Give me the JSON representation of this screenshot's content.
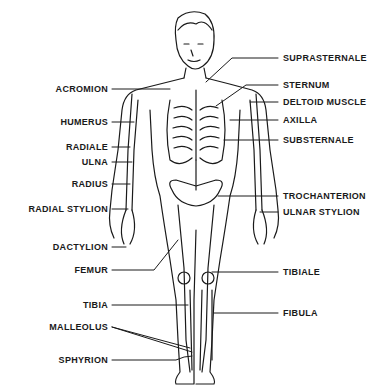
{
  "diagram": {
    "type": "anatomical-landmarks",
    "left_labels": [
      {
        "id": "acromion",
        "text": "ACROMION",
        "y": 89
      },
      {
        "id": "humerus",
        "text": "HUMERUS",
        "y": 122
      },
      {
        "id": "radiale",
        "text": "RADIALE",
        "y": 147
      },
      {
        "id": "ulna",
        "text": "ULNA",
        "y": 162
      },
      {
        "id": "radius",
        "text": "RADIUS",
        "y": 184
      },
      {
        "id": "radial-stylion",
        "text": "RADIAL STYLION",
        "y": 209
      },
      {
        "id": "dactylion",
        "text": "DACTYLION",
        "y": 247
      },
      {
        "id": "femur",
        "text": "FEMUR",
        "y": 270
      },
      {
        "id": "tibia",
        "text": "TIBIA",
        "y": 305
      },
      {
        "id": "malleolus",
        "text": "MALLEOLUS",
        "y": 327
      },
      {
        "id": "sphyrion",
        "text": "SPHYRION",
        "y": 360
      }
    ],
    "right_labels": [
      {
        "id": "suprasternale",
        "text": "SUPRASTERNALE",
        "y": 58
      },
      {
        "id": "sternum",
        "text": "STERNUM",
        "y": 85
      },
      {
        "id": "deltoid-muscle",
        "text": "DELTOID MUSCLE",
        "y": 102
      },
      {
        "id": "axilla",
        "text": "AXILLA",
        "y": 120
      },
      {
        "id": "substernale",
        "text": "SUBSTERNALE",
        "y": 140
      },
      {
        "id": "trochanterion",
        "text": "TROCHANTERION",
        "y": 196
      },
      {
        "id": "ulnar-stylion",
        "text": "ULNAR STYLION",
        "y": 212
      },
      {
        "id": "tibiale",
        "text": "TIBIALE",
        "y": 272
      },
      {
        "id": "fibula",
        "text": "FIBULA",
        "y": 313
      }
    ]
  },
  "colors": {
    "line": "#1a1a1a",
    "background": "#ffffff"
  }
}
